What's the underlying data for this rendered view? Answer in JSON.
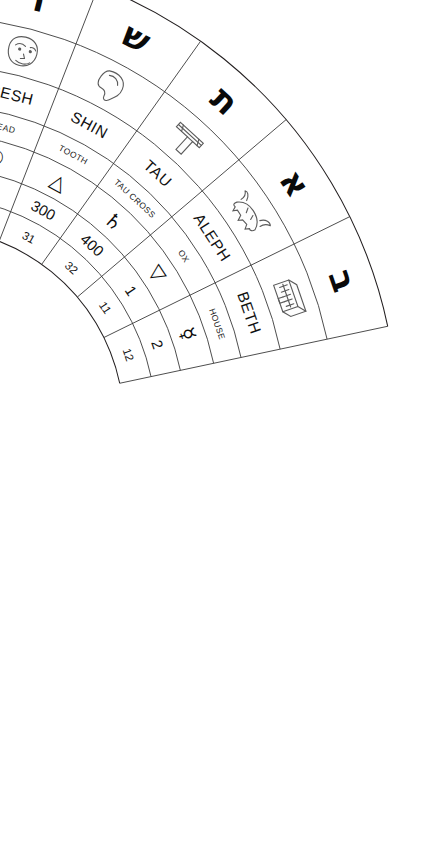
{
  "diagram": {
    "type": "radial-table",
    "ring_order": [
      "hebrew-letter",
      "pictograph",
      "name",
      "meaning",
      "astrological-symbol",
      "gematria-value",
      "path-number"
    ],
    "ink_color": "#231f20",
    "background_color": "#ffffff"
  },
  "rings": {
    "letter_label": "Hebrew letter",
    "pictograph_label": "Pictograph",
    "name_label": "Letter name",
    "meaning_label": "Meaning",
    "astro_label": "Astrological correspondence",
    "gematria_label": "Numeric value",
    "path_label": "Path number"
  },
  "cells": [
    {
      "name": "NUN",
      "hebrew": "נ",
      "meaning": "FISH",
      "pictograph": "fish-icon",
      "astro": "♏",
      "astro_name": "scorpio-icon",
      "value": "50",
      "path": "24"
    },
    {
      "name": "SAMECH",
      "hebrew": "ס",
      "meaning": "STAFF",
      "pictograph": "staff-icon",
      "astro": "♐",
      "astro_name": "sagittarius-icon",
      "value": "60",
      "path": "25"
    },
    {
      "name": "AYIN",
      "hebrew": "ע",
      "meaning": "EYE",
      "pictograph": "eye-icon",
      "astro": "♑",
      "astro_name": "capricorn-icon",
      "value": "70",
      "path": "26"
    },
    {
      "name": "PEH",
      "hebrew": "פ",
      "meaning": "MOUTH",
      "pictograph": "mouth-icon",
      "astro": "♂",
      "astro_name": "mars-icon",
      "value": "80",
      "path": "27"
    },
    {
      "name": "TZADDI",
      "hebrew": "צ",
      "meaning": "FISH HOOK",
      "pictograph": "fish-hook-icon",
      "astro": "♒",
      "astro_name": "aquarius-icon",
      "value": "90",
      "path": "28"
    },
    {
      "name": "QOPH",
      "hebrew": "ק",
      "meaning": "BACK OF HEAD",
      "pictograph": "back-of-head-icon",
      "astro": "♓",
      "astro_name": "pisces-icon",
      "value": "100",
      "path": "29"
    },
    {
      "name": "RESH",
      "hebrew": "ר",
      "meaning": "HEAD",
      "pictograph": "head-icon",
      "astro": "☉",
      "astro_name": "sun-icon",
      "value": "200",
      "path": "30"
    },
    {
      "name": "SHIN",
      "hebrew": "ש",
      "meaning": "TOOTH",
      "pictograph": "tooth-icon",
      "astro": "△",
      "astro_name": "fire-triangle-icon",
      "value": "300",
      "path": "31"
    },
    {
      "name": "TAU",
      "hebrew": "ת",
      "meaning": "TAU CROSS",
      "pictograph": "tau-cross-icon",
      "astro": "♄",
      "astro_name": "saturn-icon",
      "value": "400",
      "path": "32"
    },
    {
      "name": "ALEPH",
      "hebrew": "א",
      "meaning": "OX",
      "pictograph": "ox-icon",
      "astro": "▽",
      "astro_name": "air-triangle-icon",
      "value": "1",
      "path": "11"
    },
    {
      "name": "BETH",
      "hebrew": "ב",
      "meaning": "HOUSE",
      "pictograph": "house-icon",
      "astro": "☿",
      "astro_name": "mercury-icon",
      "value": "2",
      "path": "12"
    }
  ]
}
